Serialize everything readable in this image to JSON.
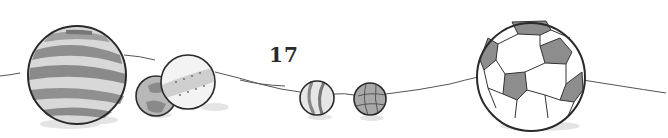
{
  "page": {
    "number": "17"
  },
  "illustration": {
    "subject": "hand-drawn balls resting along a thin line",
    "colors": {
      "ink": "#2a2a2a",
      "shade": "#9a9a9a",
      "light_shade": "#c8c8c8",
      "shadow": "#e2e2e2",
      "background": "#ffffff"
    },
    "balls": [
      {
        "name": "large-striped-ball",
        "cx": 77,
        "cy": 75,
        "r": 49
      },
      {
        "name": "small-patched-ball",
        "cx": 156,
        "cy": 96,
        "r": 20
      },
      {
        "name": "dotted-band-ball",
        "cx": 188,
        "cy": 82,
        "r": 27
      },
      {
        "name": "striped-marble",
        "cx": 317,
        "cy": 98,
        "r": 17
      },
      {
        "name": "checkered-marble",
        "cx": 370,
        "cy": 99,
        "r": 16
      },
      {
        "name": "soccer-ball",
        "cx": 531,
        "cy": 77,
        "r": 54
      }
    ]
  }
}
